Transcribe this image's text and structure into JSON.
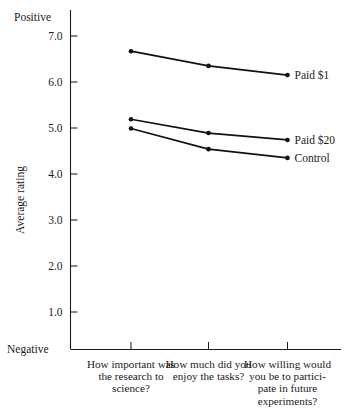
{
  "chart_data": {
    "type": "line",
    "title": "",
    "xlabel": "",
    "ylabel": "Average rating",
    "ylim": [
      1.0,
      7.0
    ],
    "grid": false,
    "legend_position": "right-endpoint-labels",
    "axis_extremes": {
      "top": "Positive",
      "bottom": "Negative"
    },
    "yticks": [
      "7.0",
      "6.0",
      "5.0",
      "4.0",
      "3.0",
      "2.0",
      "1.0"
    ],
    "ytick_values": [
      7.0,
      6.0,
      5.0,
      4.0,
      3.0,
      2.0,
      1.0
    ],
    "categories": [
      "How important was the research to science?",
      "How much did you enjoy the tasks?",
      "How willing would you be to participate in future experiments?"
    ],
    "category_lines": [
      [
        "How important was",
        "the research to",
        "science?"
      ],
      [
        "How much did you",
        "enjoy the tasks?"
      ],
      [
        "How willing would",
        "you be to partici-",
        "pate in future",
        "experiments?"
      ]
    ],
    "series": [
      {
        "name": "Paid $1",
        "values": [
          6.67,
          6.35,
          6.15
        ]
      },
      {
        "name": "Paid $20",
        "values": [
          5.19,
          4.89,
          4.74
        ]
      },
      {
        "name": "Control",
        "values": [
          4.99,
          4.54,
          4.35
        ]
      }
    ],
    "colors": {
      "line": "#111111",
      "marker": "#111111",
      "axis": "#1a1a1a",
      "text": "#1a1a1a",
      "background": "#ffffff"
    }
  }
}
